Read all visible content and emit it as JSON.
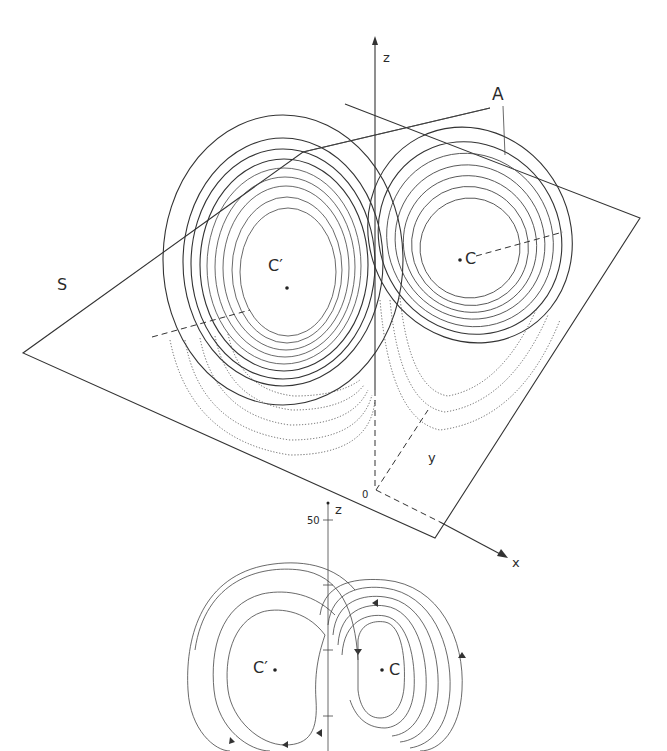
{
  "figure_top": {
    "title": "Lorenz attractor in (x, y, z) space with Poincare section plane",
    "labels": {
      "plane": "S",
      "attractor": "A",
      "fixed_point_left": "C′",
      "fixed_point_right": "C",
      "origin": "0",
      "axis_x": "x",
      "axis_y": "y",
      "axis_z": "z"
    }
  },
  "figure_bottom": {
    "title": "Projection of the Lorenz attractor onto the (x, z) plane",
    "labels": {
      "axis_z": "z",
      "z_tick": "50",
      "fixed_point_left": "C′",
      "fixed_point_right": "C"
    }
  },
  "colors": {
    "ink": "#333333",
    "background": "#ffffff"
  }
}
